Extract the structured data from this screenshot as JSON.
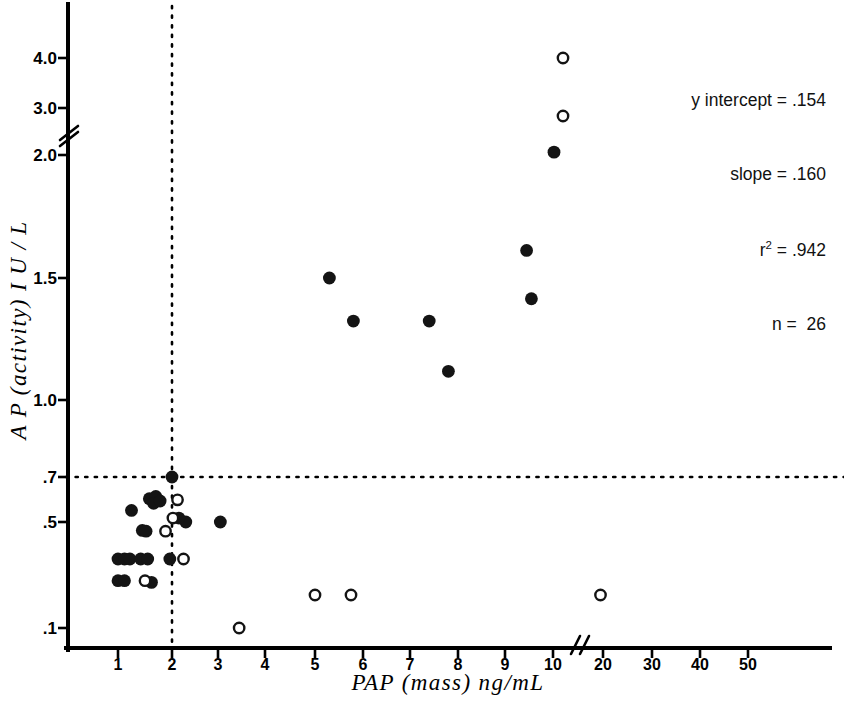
{
  "chart_data": {
    "type": "scatter",
    "title": "",
    "xlabel": "PAP (mass)  ng/mL",
    "ylabel": "A P  (activity)  I U / L",
    "x_ticks": [
      "1",
      "2",
      "3",
      "4",
      "5",
      "6",
      "7",
      "8",
      "9",
      "10",
      "20",
      "30",
      "40",
      "50"
    ],
    "y_ticks": [
      "4.0",
      "3.0",
      "2.0",
      "1.5",
      "1.0",
      ".7",
      ".5",
      ".1"
    ],
    "x_axis_break_after": "10",
    "y_axis_break_between": [
      "2.0",
      "3.0"
    ],
    "grid": false,
    "legend": null,
    "reference_lines": [
      {
        "orientation": "horizontal",
        "value": 0.7,
        "style": "dotted"
      },
      {
        "orientation": "vertical",
        "value": 2.0,
        "style": "dotted"
      }
    ],
    "series": [
      {
        "name": "filled",
        "marker": "filled-circle",
        "points": [
          {
            "x": 1.25,
            "y": 0.545
          },
          {
            "x": 1.58,
            "y": 0.595
          },
          {
            "x": 1.7,
            "y": 0.605
          },
          {
            "x": 1.66,
            "y": 0.575
          },
          {
            "x": 1.78,
            "y": 0.585
          },
          {
            "x": 2.0,
            "y": 0.7
          },
          {
            "x": 2.3,
            "y": 0.5
          },
          {
            "x": 2.15,
            "y": 0.515
          },
          {
            "x": 3.05,
            "y": 0.5
          },
          {
            "x": 1.45,
            "y": 0.44
          },
          {
            "x": 1.52,
            "y": 0.435
          },
          {
            "x": 1.0,
            "y": 0.285
          },
          {
            "x": 1.12,
            "y": 0.285
          },
          {
            "x": 1.22,
            "y": 0.285
          },
          {
            "x": 1.42,
            "y": 0.285
          },
          {
            "x": 1.55,
            "y": 0.285
          },
          {
            "x": 1.96,
            "y": 0.285
          },
          {
            "x": 1.0,
            "y": 0.205
          },
          {
            "x": 1.12,
            "y": 0.205
          },
          {
            "x": 1.62,
            "y": 0.2
          },
          {
            "x": 5.3,
            "y": 1.5
          },
          {
            "x": 5.8,
            "y": 1.3
          },
          {
            "x": 7.4,
            "y": 1.3
          },
          {
            "x": 7.8,
            "y": 1.1
          },
          {
            "x": 9.45,
            "y": 1.6
          },
          {
            "x": 9.55,
            "y": 1.4
          },
          {
            "x": 10.2,
            "y": 2.05
          }
        ]
      },
      {
        "name": "open",
        "marker": "open-circle",
        "points": [
          {
            "x": 2.12,
            "y": 0.59
          },
          {
            "x": 2.02,
            "y": 0.515
          },
          {
            "x": 1.88,
            "y": 0.435
          },
          {
            "x": 2.25,
            "y": 0.285
          },
          {
            "x": 1.5,
            "y": 0.205
          },
          {
            "x": 3.45,
            "y": 0.1
          },
          {
            "x": 5.0,
            "y": 0.165
          },
          {
            "x": 5.75,
            "y": 0.165
          },
          {
            "x": 19.5,
            "y": 0.165
          },
          {
            "x": 12.0,
            "y": 2.8
          },
          {
            "x": 12.0,
            "y": 4.15
          }
        ]
      }
    ],
    "annotations": {
      "y_intercept_label": "y intercept = .154",
      "slope_label": "slope = .160",
      "r2_label_prefix": "r",
      "r2_label_sup": "2",
      "r2_label_suffix": " = .942",
      "n_label": "n =  26"
    }
  }
}
